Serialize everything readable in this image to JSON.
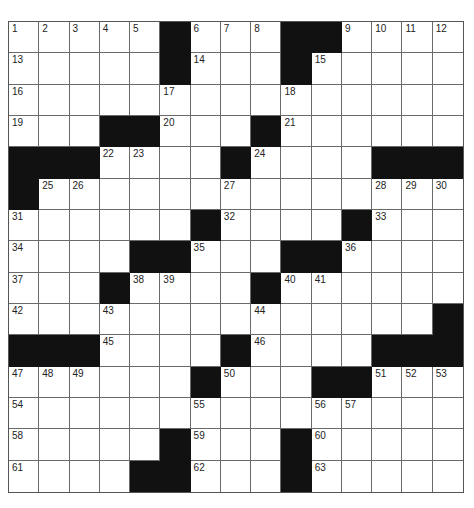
{
  "puzzle": {
    "size": {
      "rows": 15,
      "cols": 15
    },
    "layout": [
      ".....#...##....",
      ".....#...#.....",
      "...............",
      "...##...#......",
      "###....#....###",
      "#..............",
      "......#....#...",
      "....##...##....",
      "...#....#......",
      "..............#",
      "###....#....###",
      "......#...##...",
      "...............",
      ".....#...#.....",
      "....##...#....."
    ],
    "numbers": [
      {
        "r": 0,
        "c": 0,
        "n": "1"
      },
      {
        "r": 0,
        "c": 1,
        "n": "2"
      },
      {
        "r": 0,
        "c": 2,
        "n": "3"
      },
      {
        "r": 0,
        "c": 3,
        "n": "4"
      },
      {
        "r": 0,
        "c": 4,
        "n": "5"
      },
      {
        "r": 0,
        "c": 6,
        "n": "6"
      },
      {
        "r": 0,
        "c": 7,
        "n": "7"
      },
      {
        "r": 0,
        "c": 8,
        "n": "8"
      },
      {
        "r": 0,
        "c": 11,
        "n": "9"
      },
      {
        "r": 0,
        "c": 12,
        "n": "10"
      },
      {
        "r": 0,
        "c": 13,
        "n": "11"
      },
      {
        "r": 0,
        "c": 14,
        "n": "12"
      },
      {
        "r": 1,
        "c": 0,
        "n": "13"
      },
      {
        "r": 1,
        "c": 6,
        "n": "14"
      },
      {
        "r": 1,
        "c": 10,
        "n": "15"
      },
      {
        "r": 2,
        "c": 0,
        "n": "16"
      },
      {
        "r": 2,
        "c": 5,
        "n": "17"
      },
      {
        "r": 2,
        "c": 9,
        "n": "18"
      },
      {
        "r": 3,
        "c": 0,
        "n": "19"
      },
      {
        "r": 3,
        "c": 5,
        "n": "20"
      },
      {
        "r": 3,
        "c": 9,
        "n": "21"
      },
      {
        "r": 4,
        "c": 3,
        "n": "22"
      },
      {
        "r": 4,
        "c": 4,
        "n": "23"
      },
      {
        "r": 4,
        "c": 8,
        "n": "24"
      },
      {
        "r": 5,
        "c": 1,
        "n": "25"
      },
      {
        "r": 5,
        "c": 2,
        "n": "26"
      },
      {
        "r": 5,
        "c": 7,
        "n": "27"
      },
      {
        "r": 5,
        "c": 12,
        "n": "28"
      },
      {
        "r": 5,
        "c": 13,
        "n": "29"
      },
      {
        "r": 5,
        "c": 14,
        "n": "30"
      },
      {
        "r": 6,
        "c": 0,
        "n": "31"
      },
      {
        "r": 6,
        "c": 7,
        "n": "32"
      },
      {
        "r": 6,
        "c": 12,
        "n": "33"
      },
      {
        "r": 7,
        "c": 0,
        "n": "34"
      },
      {
        "r": 7,
        "c": 6,
        "n": "35"
      },
      {
        "r": 7,
        "c": 11,
        "n": "36"
      },
      {
        "r": 8,
        "c": 0,
        "n": "37"
      },
      {
        "r": 8,
        "c": 4,
        "n": "38"
      },
      {
        "r": 8,
        "c": 5,
        "n": "39"
      },
      {
        "r": 8,
        "c": 9,
        "n": "40"
      },
      {
        "r": 8,
        "c": 10,
        "n": "41"
      },
      {
        "r": 9,
        "c": 0,
        "n": "42"
      },
      {
        "r": 9,
        "c": 3,
        "n": "43"
      },
      {
        "r": 9,
        "c": 8,
        "n": "44"
      },
      {
        "r": 10,
        "c": 3,
        "n": "45"
      },
      {
        "r": 10,
        "c": 8,
        "n": "46"
      },
      {
        "r": 11,
        "c": 0,
        "n": "47"
      },
      {
        "r": 11,
        "c": 1,
        "n": "48"
      },
      {
        "r": 11,
        "c": 2,
        "n": "49"
      },
      {
        "r": 11,
        "c": 7,
        "n": "50"
      },
      {
        "r": 11,
        "c": 12,
        "n": "51"
      },
      {
        "r": 11,
        "c": 13,
        "n": "52"
      },
      {
        "r": 11,
        "c": 14,
        "n": "53"
      },
      {
        "r": 12,
        "c": 0,
        "n": "54"
      },
      {
        "r": 12,
        "c": 6,
        "n": "55"
      },
      {
        "r": 12,
        "c": 10,
        "n": "56"
      },
      {
        "r": 12,
        "c": 11,
        "n": "57"
      },
      {
        "r": 13,
        "c": 0,
        "n": "58"
      },
      {
        "r": 13,
        "c": 6,
        "n": "59"
      },
      {
        "r": 13,
        "c": 10,
        "n": "60"
      },
      {
        "r": 14,
        "c": 0,
        "n": "61"
      },
      {
        "r": 14,
        "c": 6,
        "n": "62"
      },
      {
        "r": 14,
        "c": 10,
        "n": "63"
      }
    ],
    "entries": [],
    "colors": {
      "block": "#111111",
      "cell": "#ffffff",
      "line": "#6a6a6a",
      "number": "#222222"
    }
  }
}
